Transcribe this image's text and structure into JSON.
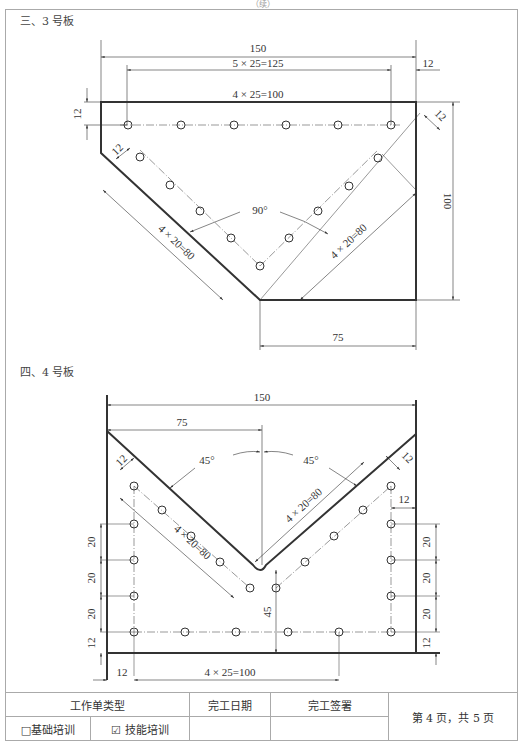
{
  "page_header": "（续）",
  "section3": {
    "title": "三、3 号板",
    "dims": {
      "overall_width": "150",
      "hole_span": "5 × 25=125",
      "right_offset": "12",
      "inner_span": "4 × 25=100",
      "top_offset": "12",
      "left_diag_offset": "12",
      "right_diag_offset": "12",
      "angle": "90°",
      "left_diag_pitch": "4 × 20=80",
      "right_diag_pitch": "4 × 20=80",
      "height": "100",
      "bottom_width": "75"
    }
  },
  "section4": {
    "title": "四、4 号板",
    "dims": {
      "overall_width": "150",
      "half_width": "75",
      "left_angle": "45°",
      "right_angle": "45°",
      "left_diag_offset": "12",
      "right_diag_offset": "12",
      "right_edge_offset": "12",
      "right_diag_pitch": "4 × 20=80",
      "left_diag_pitch": "4 × 20=80",
      "left_pitch_1": "20",
      "left_pitch_2": "20",
      "left_pitch_3": "20",
      "left_bottom_offset": "12",
      "right_pitch_1": "20",
      "right_pitch_2": "20",
      "right_pitch_3": "20",
      "right_bottom_offset": "12",
      "center_height": "45",
      "bottom_left_offset": "12",
      "bottom_span": "4 × 25=100"
    }
  },
  "footer": {
    "type_label": "工作单类型",
    "finish_date_label": "完工日期",
    "finish_sign_label": "完工签署",
    "page_info": "第 4 页，共 5 页",
    "option_basic": "□基础培训",
    "option_skill": "☑ 技能培训",
    "finish_date_value": "",
    "finish_sign_value": ""
  }
}
